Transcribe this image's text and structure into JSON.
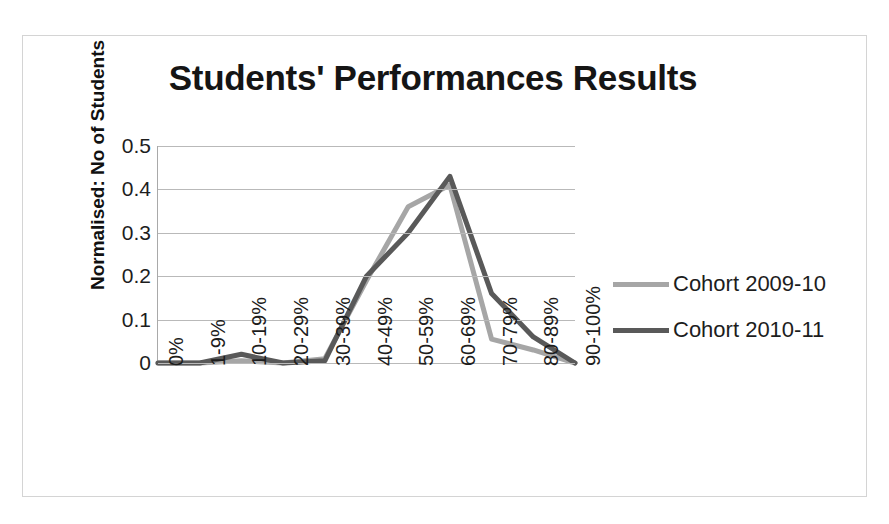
{
  "chart_data": {
    "type": "line",
    "title": "Students' Performances Results",
    "xlabel": "",
    "ylabel": "Normalised: No of Students",
    "categories": [
      "0%",
      "1-9%",
      "10-19%",
      "20-29%",
      "30-39%",
      "40-49%",
      "50-59%",
      "60-69%",
      "70-79%",
      "80-89%",
      "90-100%"
    ],
    "yticks": [
      "0.5",
      "0.4",
      "0.3",
      "0.2",
      "0.1",
      "0"
    ],
    "ylim": [
      0,
      0.5
    ],
    "grid": true,
    "legend_position": "right",
    "series": [
      {
        "name": "Cohort 2009-10",
        "color": "#a6a6a6",
        "values": [
          0,
          0,
          0.005,
          0,
          0.01,
          0.19,
          0.36,
          0.41,
          0.055,
          0.03,
          0
        ]
      },
      {
        "name": "Cohort 2010-11",
        "color": "#595959",
        "values": [
          0,
          0,
          0.02,
          0,
          0.005,
          0.2,
          0.3,
          0.43,
          0.16,
          0.06,
          0
        ]
      }
    ]
  },
  "legend": {
    "items": [
      {
        "label": "Cohort 2009-10",
        "color": "#a6a6a6"
      },
      {
        "label": "Cohort 2010-11",
        "color": "#595959"
      }
    ]
  }
}
